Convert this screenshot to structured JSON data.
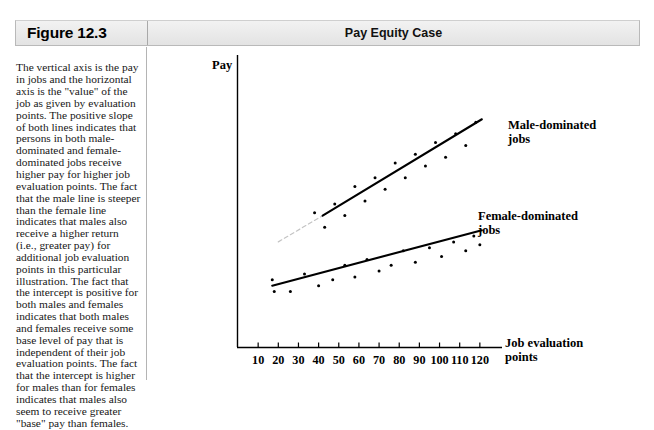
{
  "figure": {
    "label": "Figure 12.3",
    "title": "Pay Equity Case"
  },
  "caption": {
    "text": "The vertical axis is the pay in jobs and the horizontal axis is the \"value\" of the job as given by evaluation points. The positive slope of both lines indicates that persons in both male-dominated and female-dominated jobs receive higher pay for higher job evaluation points. The fact that the male line is steeper than the female line indicates that males also receive a higher return (i.e., greater pay) for additional job evaluation points in this particular illustration. The fact that the intercept is positive for both males and females indicates that both males and females receive some base level of pay that is independent of their job evaluation points. The fact that the intercept is higher for males than for females indicates that males also seem to receive greater \"base\" pay than females."
  },
  "chart_data": {
    "type": "scatter",
    "title": "Pay Equity Case",
    "xlabel": "Job evaluation points",
    "ylabel": "Pay",
    "grid": false,
    "legend_position": "inline-right",
    "xlim": [
      0,
      130
    ],
    "ylim": [
      0,
      100
    ],
    "xticks": [
      10,
      20,
      30,
      40,
      50,
      60,
      70,
      80,
      90,
      100,
      110,
      120
    ],
    "yticks": [],
    "series": [
      {
        "name": "Male-dominated jobs",
        "marker": "dot",
        "color": "#000000",
        "fit_line": {
          "style": "solid",
          "x": [
            42,
            121
          ],
          "y": [
            45,
            78
          ]
        },
        "fit_line_extension": {
          "style": "dashed",
          "color": "#c4c4c4",
          "x": [
            20,
            42
          ],
          "y": [
            36,
            45
          ]
        },
        "points": [
          {
            "x": 38,
            "y": 46
          },
          {
            "x": 43,
            "y": 41
          },
          {
            "x": 48,
            "y": 49
          },
          {
            "x": 53,
            "y": 45
          },
          {
            "x": 58,
            "y": 55
          },
          {
            "x": 63,
            "y": 50
          },
          {
            "x": 68,
            "y": 58
          },
          {
            "x": 73,
            "y": 54
          },
          {
            "x": 78,
            "y": 63
          },
          {
            "x": 83,
            "y": 58
          },
          {
            "x": 88,
            "y": 66
          },
          {
            "x": 93,
            "y": 62
          },
          {
            "x": 98,
            "y": 70
          },
          {
            "x": 103,
            "y": 65
          },
          {
            "x": 108,
            "y": 73
          },
          {
            "x": 113,
            "y": 69
          },
          {
            "x": 118,
            "y": 77
          }
        ]
      },
      {
        "name": "Female-dominated jobs",
        "marker": "dot",
        "color": "#000000",
        "fit_line": {
          "style": "solid",
          "x": [
            17,
            121
          ],
          "y": [
            21,
            40
          ]
        },
        "points": [
          {
            "x": 17,
            "y": 23
          },
          {
            "x": 18,
            "y": 19
          },
          {
            "x": 26,
            "y": 19
          },
          {
            "x": 33,
            "y": 25
          },
          {
            "x": 40,
            "y": 21
          },
          {
            "x": 47,
            "y": 23
          },
          {
            "x": 53,
            "y": 28
          },
          {
            "x": 58,
            "y": 24
          },
          {
            "x": 64,
            "y": 30
          },
          {
            "x": 70,
            "y": 26
          },
          {
            "x": 76,
            "y": 28
          },
          {
            "x": 82,
            "y": 33
          },
          {
            "x": 88,
            "y": 29
          },
          {
            "x": 95,
            "y": 34
          },
          {
            "x": 101,
            "y": 31
          },
          {
            "x": 107,
            "y": 36
          },
          {
            "x": 113,
            "y": 33
          },
          {
            "x": 117,
            "y": 38
          },
          {
            "x": 120,
            "y": 35
          }
        ]
      }
    ]
  },
  "labels": {
    "male_line_1": "Male-dominated",
    "male_line_2": "jobs",
    "female_line_1": "Female-dominated",
    "female_line_2": "jobs",
    "x_axis_line_1": "Job evaluation",
    "x_axis_line_2": "points",
    "y_axis": "Pay"
  },
  "colors": {
    "ink": "#000000",
    "header_light": "#f2f2f2",
    "header_dark": "#e3e3e3",
    "rule": "#b4b4b4",
    "dashed_extension": "#c4c4c4"
  }
}
